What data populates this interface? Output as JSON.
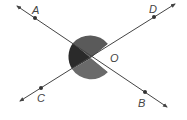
{
  "diagram": {
    "center": {
      "label": "O",
      "x": 91,
      "y": 58
    },
    "points": [
      {
        "label": "A",
        "x": 35,
        "y": 18
      },
      {
        "label": "B",
        "x": 145,
        "y": 92
      },
      {
        "label": "C",
        "x": 41,
        "y": 88
      },
      {
        "label": "D",
        "x": 154,
        "y": 17
      }
    ],
    "lines": [
      {
        "name": "AB",
        "from": "A",
        "to": "B"
      },
      {
        "name": "CD",
        "from": "C",
        "to": "D"
      }
    ],
    "colors": {
      "line": "#444444",
      "shade_dark": "#2a2a2a",
      "shade_mid": "#555555",
      "shade_light": "#7a7a7a"
    }
  }
}
